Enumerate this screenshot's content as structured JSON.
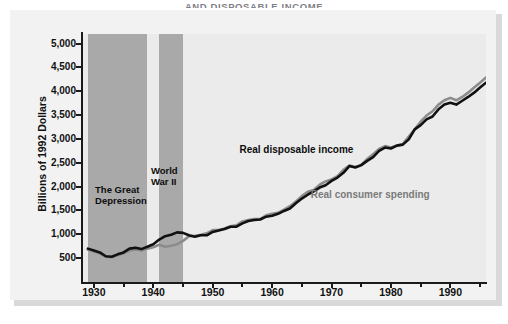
{
  "figure": {
    "title": "AND DISPOSABLE INCOME",
    "title_note": "top of title clipped by screenshot edge"
  },
  "chart_data": {
    "type": "line",
    "title": "AND DISPOSABLE INCOME",
    "xlabel": "",
    "ylabel": "Billions of 1992 Dollars",
    "xlim": [
      1928,
      1996
    ],
    "ylim": [
      0,
      5200
    ],
    "grid": false,
    "legend_position": "inline-annotations",
    "x_ticks": [
      "1930",
      "1940",
      "1950",
      "1960",
      "1970",
      "1980",
      "1990"
    ],
    "x_tick_values": [
      1930,
      1940,
      1950,
      1960,
      1970,
      1980,
      1990
    ],
    "y_ticks": [
      "500",
      "1,000",
      "1,500",
      "2,000",
      "2,500",
      "3,000",
      "3,500",
      "4,000",
      "4,500",
      "5,000"
    ],
    "y_tick_values": [
      500,
      1000,
      1500,
      2000,
      2500,
      3000,
      3500,
      4000,
      4500,
      5000
    ],
    "x": [
      1929,
      1930,
      1931,
      1932,
      1933,
      1934,
      1935,
      1936,
      1937,
      1938,
      1939,
      1940,
      1941,
      1942,
      1943,
      1944,
      1945,
      1946,
      1947,
      1948,
      1949,
      1950,
      1951,
      1952,
      1953,
      1954,
      1955,
      1956,
      1957,
      1958,
      1959,
      1960,
      1961,
      1962,
      1963,
      1964,
      1965,
      1966,
      1967,
      1968,
      1969,
      1970,
      1971,
      1972,
      1973,
      1974,
      1975,
      1976,
      1977,
      1978,
      1979,
      1980,
      1981,
      1982,
      1983,
      1984,
      1985,
      1986,
      1987,
      1988,
      1989,
      1990,
      1991,
      1992,
      1993,
      1994,
      1995,
      1996
    ],
    "series": [
      {
        "name": "Real disposable income",
        "color": "#111111",
        "values": [
          700,
          660,
          620,
          540,
          530,
          580,
          620,
          700,
          720,
          690,
          740,
          790,
          890,
          960,
          990,
          1040,
          1030,
          980,
          950,
          980,
          980,
          1050,
          1080,
          1110,
          1160,
          1160,
          1230,
          1280,
          1300,
          1310,
          1370,
          1390,
          1430,
          1490,
          1540,
          1650,
          1750,
          1830,
          1900,
          1980,
          2030,
          2120,
          2190,
          2290,
          2430,
          2400,
          2450,
          2540,
          2620,
          2750,
          2820,
          2800,
          2860,
          2880,
          2990,
          3200,
          3290,
          3410,
          3470,
          3620,
          3720,
          3760,
          3720,
          3800,
          3880,
          3970,
          4080,
          4180
        ]
      },
      {
        "name": "Real consumer spending",
        "color": "#8c8c8c",
        "values": [
          680,
          640,
          600,
          530,
          520,
          560,
          600,
          660,
          680,
          660,
          700,
          730,
          780,
          740,
          760,
          790,
          860,
          960,
          970,
          990,
          1020,
          1090,
          1090,
          1120,
          1170,
          1190,
          1270,
          1300,
          1320,
          1320,
          1400,
          1430,
          1450,
          1520,
          1590,
          1690,
          1800,
          1890,
          1930,
          2040,
          2110,
          2150,
          2220,
          2350,
          2440,
          2410,
          2450,
          2580,
          2680,
          2790,
          2850,
          2820,
          2860,
          2890,
          3050,
          3200,
          3360,
          3490,
          3580,
          3720,
          3810,
          3860,
          3810,
          3880,
          3970,
          4080,
          4180,
          4290
        ]
      }
    ],
    "annotations": [
      {
        "text": "Real disposable income",
        "series": "Real disposable income"
      },
      {
        "text": "Real consumer spending",
        "series": "Real consumer spending"
      },
      {
        "text": "The Great\nDepression",
        "span": [
          1929,
          1939
        ]
      },
      {
        "text": "World\nWar II",
        "span": [
          1941,
          1945
        ]
      }
    ],
    "shaded_bands": [
      {
        "label": "The Great Depression",
        "start": 1929,
        "end": 1939,
        "color": "#a9a9a9"
      },
      {
        "label": "World War II",
        "start": 1941,
        "end": 1945,
        "color": "#a9a9a9"
      }
    ],
    "colors": {
      "plot_background": "#ebebeb",
      "card_background": "#f2f2f2",
      "band": "#a9a9a9",
      "income_line": "#111111",
      "spending_line": "#8c8c8c",
      "axis": "#1a1a1a"
    }
  }
}
